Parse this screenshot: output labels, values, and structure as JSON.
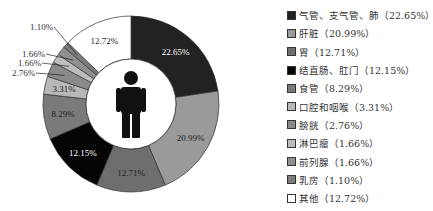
{
  "chart_data": {
    "type": "pie",
    "donut": true,
    "title": "",
    "categories": [
      "气管、支气管、肺",
      "肝脏",
      "胃",
      "结直肠、肛门",
      "食管",
      "口腔和咽喉",
      "膀胱",
      "淋巴瘤",
      "前列腺",
      "乳房",
      "其他"
    ],
    "values": [
      22.65,
      20.99,
      12.71,
      12.15,
      8.29,
      3.31,
      2.76,
      1.66,
      1.66,
      1.1,
      12.72
    ],
    "colors": [
      "#222222",
      "#9a9a9a",
      "#6e6e6e",
      "#050505",
      "#7a7a7a",
      "#b8b8b8",
      "#8a8a8a",
      "#bdbdbd",
      "#909090",
      "#7c7c7c",
      "#ffffff"
    ],
    "slice_labels": [
      "22.65%",
      "20.99%",
      "12.71%",
      "12.15%",
      "8.29%",
      "3.31%",
      "2.76%",
      "1.66%",
      "1.66%",
      "1.10%",
      "12.72%"
    ],
    "center_icon": "male-person-icon",
    "legend_position": "right"
  },
  "legend": {
    "items": [
      {
        "label": "气管、支气管、肺（22.65%）",
        "color": "#222222"
      },
      {
        "label": "肝脏（20.99%）",
        "color": "#9a9a9a"
      },
      {
        "label": "胃（12.71%）",
        "color": "#6e6e6e"
      },
      {
        "label": "结直肠、肛门（12.15%）",
        "color": "#050505"
      },
      {
        "label": "食管（8.29%）",
        "color": "#7a7a7a"
      },
      {
        "label": "口腔和咽喉（3.31%）",
        "color": "#b8b8b8"
      },
      {
        "label": "膀胱（2.76%）",
        "color": "#8a8a8a"
      },
      {
        "label": "淋巴瘤（1.66%）",
        "color": "#bdbdbd"
      },
      {
        "label": "前列腺（1.66%）",
        "color": "#909090"
      },
      {
        "label": "乳房（1.10%）",
        "color": "#7c7c7c"
      },
      {
        "label": "其他（12.72%）",
        "color": "#ffffff"
      }
    ]
  }
}
